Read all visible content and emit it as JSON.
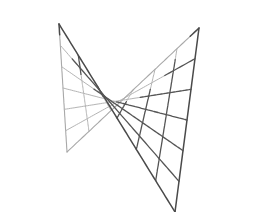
{
  "figure": {
    "surface_equation": "z = x^2 - y^2",
    "grid_lines_u": 7,
    "grid_lines_v": 7,
    "colors": {
      "background": "#ffffff",
      "front_lines": "#555555",
      "back_lines": "#b4b4b4"
    }
  }
}
